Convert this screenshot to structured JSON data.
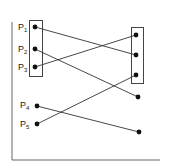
{
  "diagram": {
    "labels": {
      "p1": {
        "base": "P",
        "sub": "1"
      },
      "p2": {
        "base": "P",
        "sub": "2"
      },
      "p3": {
        "base": "P",
        "sub": "3"
      },
      "p4": {
        "base": "P",
        "sub": "4"
      },
      "p5": {
        "base": "P",
        "sub": "5"
      }
    },
    "left_points": [
      {
        "id": "P1",
        "x": 35,
        "y": 27
      },
      {
        "id": "P2",
        "x": 35,
        "y": 49
      },
      {
        "id": "P3",
        "x": 35,
        "y": 67
      },
      {
        "id": "P4",
        "x": 37,
        "y": 106
      },
      {
        "id": "P5",
        "x": 37,
        "y": 124
      }
    ],
    "right_points": [
      {
        "x": 136,
        "y": 35
      },
      {
        "x": 136,
        "y": 55
      },
      {
        "x": 136,
        "y": 75
      },
      {
        "x": 138,
        "y": 97
      },
      {
        "x": 139,
        "y": 132
      }
    ],
    "connections": [
      {
        "from": "P1",
        "to_index": 1
      },
      {
        "from": "P2",
        "to_index": 3
      },
      {
        "from": "P3",
        "to_index": 0
      },
      {
        "from": "P4",
        "to_index": 4
      },
      {
        "from": "P5",
        "to_index": 2
      }
    ],
    "colors": {
      "line": "#333333",
      "point": "#111111"
    }
  }
}
